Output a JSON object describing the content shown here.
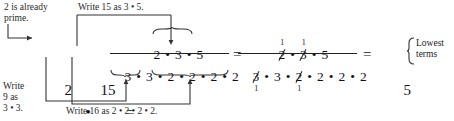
{
  "problem": {
    "expression": "2/9 • 15/16",
    "result": "5/24"
  },
  "annotations": {
    "prime_note_line1": "2 is already",
    "prime_note_line2": "prime.",
    "write15": "Write 15 as 3 • 5.",
    "write9_line1": "Write",
    "write9_line2": "9 as",
    "write9_line3": "3 • 3.",
    "write16": "Write 16 as 2 • 2 • 2 • 2.",
    "lowest_line1": "Lowest",
    "lowest_line2": "terms"
  },
  "step1": {
    "frac1_num": "2",
    "frac1_den": "9",
    "dot": "•",
    "frac2_num": "15",
    "frac2_den": "16",
    "equals": "="
  },
  "step2": {
    "numerator": [
      "2",
      "•",
      "3",
      "•",
      "5"
    ],
    "denominator": [
      "3",
      "•",
      "3",
      "•",
      "2",
      "•",
      "2",
      "•",
      "2",
      "•",
      "2"
    ],
    "equals": "="
  },
  "step3": {
    "numerator": [
      "2",
      "•",
      "3",
      "•",
      "5"
    ],
    "numerator_cancelled": [
      true,
      false,
      true,
      false,
      false
    ],
    "numerator_marks": [
      "1",
      "",
      "1",
      "",
      ""
    ],
    "denominator": [
      "3",
      "•",
      "3",
      "•",
      "2",
      "•",
      "2",
      "•",
      "2",
      "•",
      "2"
    ],
    "denominator_cancelled": [
      true,
      false,
      false,
      false,
      true,
      false,
      false,
      false,
      false,
      false,
      false
    ],
    "denominator_marks": [
      "1",
      "",
      "",
      "",
      "1",
      "",
      "",
      "",
      "",
      "",
      ""
    ],
    "equals": "="
  },
  "answer": {
    "num": "5",
    "den": "24"
  },
  "colors": {
    "ink": "#1a1a1a",
    "rule": "#222222",
    "background": "#ffffff"
  }
}
